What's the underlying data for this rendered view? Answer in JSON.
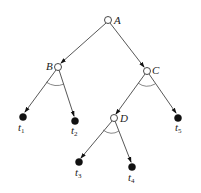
{
  "diagram": {
    "type": "and-or-tree",
    "nodes": [
      {
        "id": "A",
        "label": "A",
        "kind": "open",
        "x": 108,
        "y": 20
      },
      {
        "id": "B",
        "label": "B",
        "kind": "open",
        "x": 58,
        "y": 67
      },
      {
        "id": "C",
        "label": "C",
        "kind": "open",
        "x": 147,
        "y": 71
      },
      {
        "id": "D",
        "label": "D",
        "kind": "open",
        "x": 114,
        "y": 118
      },
      {
        "id": "t1",
        "label": "t",
        "sub": "1",
        "kind": "terminal",
        "x": 23,
        "y": 116
      },
      {
        "id": "t2",
        "label": "t",
        "sub": "2",
        "kind": "terminal",
        "x": 75,
        "y": 120
      },
      {
        "id": "t3",
        "label": "t",
        "sub": "3",
        "kind": "terminal",
        "x": 79,
        "y": 162
      },
      {
        "id": "t4",
        "label": "t",
        "sub": "4",
        "kind": "terminal",
        "x": 132,
        "y": 166
      },
      {
        "id": "t5",
        "label": "t",
        "sub": "5",
        "kind": "terminal",
        "x": 178,
        "y": 117
      }
    ],
    "edges": [
      {
        "from": "A",
        "to": "B"
      },
      {
        "from": "A",
        "to": "C"
      },
      {
        "from": "B",
        "to": "t1"
      },
      {
        "from": "B",
        "to": "t2"
      },
      {
        "from": "C",
        "to": "D"
      },
      {
        "from": "C",
        "to": "t5"
      },
      {
        "from": "D",
        "to": "t3"
      },
      {
        "from": "D",
        "to": "t4"
      }
    ],
    "and_arcs": [
      "B",
      "C",
      "D"
    ]
  }
}
